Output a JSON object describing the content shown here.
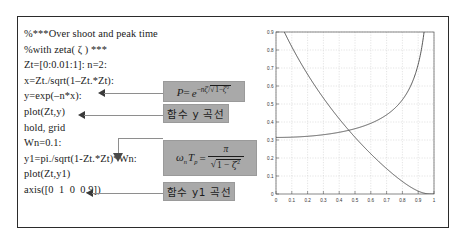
{
  "figure": {
    "code_lines": [
      "%***Over shoot and peak time",
      "%with zeta( ζ ) ***",
      "Zt=[0:0.01:1]: n=2:",
      "x=Zt./sqrt(1–Zt.*Zt):",
      "y=exp(–n*x):",
      "plot(Zt,y)",
      "hold, grid",
      "Wn=0.1:",
      "y1=pi./sqrt(1-Zt.*Zt)*Wn:",
      "plot(Zt,y1)",
      "axis([0  1  0  0.9])"
    ],
    "annotations": {
      "formula_overshoot": {
        "lhs": "P",
        "eq": "=",
        "base": "e",
        "exponent_numerator": "–nζ",
        "exponent_denominator": "√(1–ζ²)",
        "plain": "P = e^(-nζ/√(1-ζ²))"
      },
      "label_y_curve": "함수 y 곡선",
      "formula_peaktime": {
        "lhs_omega": "ω",
        "lhs_omega_sub": "n",
        "lhs_T": "T",
        "lhs_T_sub": "p",
        "eq": "=",
        "numerator": "π",
        "denominator_radical": "1 – ζ",
        "denominator_power": "2",
        "plain": "ωₙTₚ = π / √(1–ζ²)"
      },
      "label_y1_curve": "함수 y1 곡선"
    },
    "colors": {
      "box_fill": "#a9a9a9",
      "frame_border": "#2b2b2b",
      "connector": "#8e8e8e",
      "curve": "#444444",
      "grid": "#c9c9c9"
    }
  },
  "chart_data": {
    "type": "line",
    "title": "",
    "xlabel": "",
    "ylabel": "",
    "xlim": [
      0,
      1
    ],
    "ylim": [
      0,
      0.9
    ],
    "grid": true,
    "legend": "none",
    "xticks": [
      0,
      0.1,
      0.2,
      0.3,
      0.4,
      0.5,
      0.6,
      0.7,
      0.8,
      0.9,
      1
    ],
    "xticklabels": [
      "0",
      "0.1",
      "0.2",
      "0.3",
      "0.4",
      "0.5",
      "0.6",
      "0.7",
      "0.8",
      "0.9",
      "1"
    ],
    "yticks": [
      0,
      0.1,
      0.2,
      0.3,
      0.4,
      0.5,
      0.6,
      0.7,
      0.8,
      0.9
    ],
    "yticklabels": [
      "0",
      "0.1",
      "0.2",
      "0.3",
      "0.4",
      "0.5",
      "0.6",
      "0.7",
      "0.8",
      "0.9"
    ],
    "x": [
      0,
      0.05,
      0.1,
      0.15,
      0.2,
      0.25,
      0.3,
      0.35,
      0.4,
      0.45,
      0.5,
      0.55,
      0.6,
      0.65,
      0.7,
      0.75,
      0.8,
      0.85,
      0.9,
      0.95,
      1
    ],
    "series": [
      {
        "name": "y = exp(-n*Zt/sqrt(1-Zt^2))",
        "values": [
          1.0,
          0.905,
          0.818,
          0.738,
          0.665,
          0.597,
          0.534,
          0.475,
          0.42,
          0.367,
          0.317,
          0.269,
          0.223,
          0.179,
          0.137,
          0.097,
          0.061,
          0.031,
          0.009,
          0.0004,
          0.0
        ]
      },
      {
        "name": "y1 = pi/sqrt(1-Zt^2)*Wn",
        "values": [
          0.3142,
          0.3146,
          0.3158,
          0.3178,
          0.3206,
          0.3246,
          0.3293,
          0.3354,
          0.3428,
          0.3517,
          0.3628,
          0.3762,
          0.3927,
          0.4134,
          0.4399,
          0.4748,
          0.5236,
          0.5965,
          0.7207,
          0.1006,
          0.0
        ]
      }
    ]
  }
}
